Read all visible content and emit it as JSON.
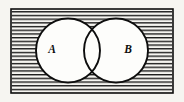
{
  "figure": {
    "kind": "venn-diagram",
    "background_color": "#f6f5f1",
    "ink_color": "#0d0d0d",
    "circle_fill_color": "#fdfdfb",
    "hatch_color": "#1a1a1a"
  },
  "universe": {
    "name": "universal-set-rectangle",
    "shaded": true,
    "shading_style": "horizontal-hatch",
    "hatch_spacing_px": 3.7,
    "x": 11,
    "y": 9,
    "width": 162,
    "height": 84,
    "stroke_width": 1.6
  },
  "sets": [
    {
      "id": "A",
      "label": "A",
      "name": "circle-a",
      "cx": 68,
      "cy": 50.5,
      "r": 32,
      "label_x": 52,
      "label_y": 50.5,
      "stroke_width": 1.9
    },
    {
      "id": "B",
      "label": "B",
      "name": "circle-b",
      "cx": 116,
      "cy": 50.5,
      "r": 32,
      "label_x": 128,
      "label_y": 50.5,
      "stroke_width": 1.9
    }
  ],
  "overlap": {
    "name": "intersection-lens",
    "present": true,
    "left_x": 84,
    "right_x": 100
  }
}
